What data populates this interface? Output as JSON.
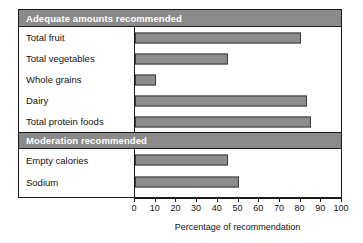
{
  "chart_data": {
    "type": "bar",
    "orientation": "horizontal",
    "title": "",
    "xlabel": "Percentage of recommendation",
    "ylabel": "",
    "xlim": [
      0,
      100
    ],
    "xticks": [
      0,
      10,
      20,
      30,
      40,
      50,
      60,
      70,
      80,
      90,
      100
    ],
    "xtick_labels": [
      "0",
      "10",
      "20",
      "30",
      "40",
      "50",
      "60",
      "70",
      "80",
      "90",
      "100"
    ],
    "grid": false,
    "legend": null,
    "bar_color": "#8c8c8c",
    "bar_edge_color": "#3a3a3a",
    "header_band_color": "#8a8a8a",
    "header_text_color": "#ffffff",
    "frame_color": "#1a1a1a",
    "groups": [
      {
        "header": "Adequate amounts recommended",
        "categories": [
          "Total fruit",
          "Total vegetables",
          "Whole grains",
          "Dairy",
          "Total protein foods"
        ],
        "values": [
          80,
          45,
          10,
          83,
          85
        ]
      },
      {
        "header": "Moderation recommended",
        "categories": [
          "Empty calories",
          "Sodium"
        ],
        "values": [
          45,
          50
        ]
      }
    ]
  }
}
